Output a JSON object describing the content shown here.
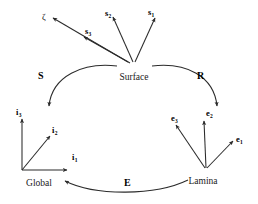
{
  "figure": {
    "type": "diagram",
    "subtype": "coordinate-frame-transformation-cycle",
    "background_color": "#ffffff",
    "stroke_color": "#2b2b2b",
    "text_color": "#111111"
  },
  "nodes": {
    "surface": {
      "label": "Surface",
      "x": 134,
      "y": 73
    },
    "global": {
      "label": "Global",
      "x": 39,
      "y": 179
    },
    "lamina": {
      "label": "Lamina",
      "x": 203,
      "y": 177
    }
  },
  "transforms": {
    "s": {
      "label": "S",
      "x": 38,
      "y": 71,
      "from": "Global",
      "to": "Surface"
    },
    "r": {
      "label": "R",
      "x": 197,
      "y": 71,
      "from": "Surface",
      "to": "Lamina"
    },
    "e": {
      "label": "E",
      "x": 124,
      "y": 178,
      "from": "Lamina",
      "to": "Global"
    }
  },
  "surface_frame": {
    "vectors": [
      {
        "name": "s1",
        "base": "s",
        "sub": "1",
        "x": 148,
        "y": 8
      },
      {
        "name": "s2",
        "base": "s",
        "sub": "2",
        "x": 105,
        "y": 9
      },
      {
        "name": "s3",
        "base": "s",
        "sub": "3",
        "x": 85,
        "y": 27
      },
      {
        "name": "zeta",
        "base": "ζ",
        "sub": "",
        "x": 42,
        "y": 13
      }
    ]
  },
  "global_frame": {
    "vectors": [
      {
        "name": "i1",
        "base": "i",
        "sub": "1",
        "x": 72,
        "y": 153
      },
      {
        "name": "i2",
        "base": "i",
        "sub": "2",
        "x": 52,
        "y": 126
      },
      {
        "name": "i3",
        "base": "i",
        "sub": "3",
        "x": 16,
        "y": 108
      }
    ]
  },
  "lamina_frame": {
    "vectors": [
      {
        "name": "e1",
        "base": "e",
        "sub": "1",
        "x": 236,
        "y": 135
      },
      {
        "name": "e2",
        "base": "e",
        "sub": "2",
        "x": 206,
        "y": 109
      },
      {
        "name": "e3",
        "base": "e",
        "sub": "3",
        "x": 171,
        "y": 114
      }
    ]
  }
}
